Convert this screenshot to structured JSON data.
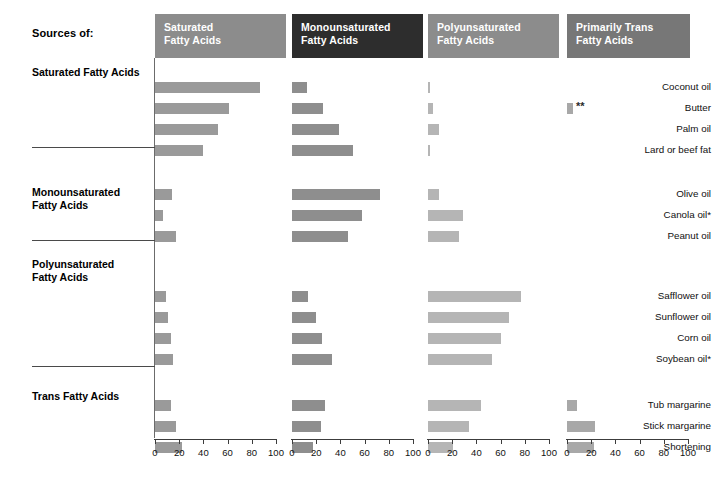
{
  "title_label": "Sources of:",
  "footnote_marks": {
    "double_asterisk": "**"
  },
  "caption": "",
  "colors": {
    "header_saturated": "#8c8c8c",
    "header_monounsaturated": "#2d2d2d",
    "header_polyunsaturated": "#8c8c8c",
    "header_trans": "#777777",
    "bar_saturated": "#9a9a9a",
    "bar_monounsaturated": "#8e8e8e",
    "bar_polyunsaturated": "#b5b5b5",
    "bar_trans": "#a8a8a8",
    "axis": "#3c3c3c",
    "rule": "#4a4a4a",
    "text": "#111111"
  },
  "chart_data": {
    "type": "bar",
    "xlabel": "",
    "ylabel": "",
    "xlim": [
      0,
      100
    ],
    "xticks": [
      0,
      20,
      40,
      60,
      80,
      100
    ],
    "grid": false,
    "legend": "none",
    "panels": [
      {
        "key": "saturated",
        "label": "Saturated\nFatty Acids"
      },
      {
        "key": "monounsaturated",
        "label": "Monounsaturated\nFatty Acids"
      },
      {
        "key": "polyunsaturated",
        "label": "Polyunsaturated\nFatty Acids"
      },
      {
        "key": "trans",
        "label": "Primarily Trans\nFatty Acids"
      }
    ],
    "groups": [
      {
        "title": "Saturated Fatty Acids",
        "rows": [
          {
            "label": "Coconut oil",
            "values": [
              87,
              12,
              2,
              0
            ]
          },
          {
            "label": "Butter",
            "values": [
              61,
              26,
              4,
              5
            ],
            "marks": [
              null,
              null,
              null,
              "**"
            ]
          },
          {
            "label": "Palm oil",
            "values": [
              52,
              39,
              9,
              0
            ]
          },
          {
            "label": "Lard or beef fat",
            "values": [
              40,
              50,
              2,
              0
            ]
          }
        ]
      },
      {
        "title": "Monounsaturated\nFatty Acids",
        "rows": [
          {
            "label": "Olive oil",
            "values": [
              14,
              73,
              9,
              0
            ]
          },
          {
            "label": "Canola oil*",
            "values": [
              7,
              58,
              29,
              0
            ]
          },
          {
            "label": "Peanut oil",
            "values": [
              17,
              46,
              26,
              0
            ]
          }
        ]
      },
      {
        "title": "Polyunsaturated\nFatty Acids",
        "rows": [
          {
            "label": "Safflower oil",
            "values": [
              9,
              13,
              77,
              0
            ]
          },
          {
            "label": "Sunflower oil",
            "values": [
              11,
              20,
              67,
              0
            ]
          },
          {
            "label": "Corn oil",
            "values": [
              13,
              25,
              60,
              0
            ]
          },
          {
            "label": "Soybean oil*",
            "values": [
              15,
              33,
              53,
              0
            ]
          }
        ]
      },
      {
        "title": "Trans Fatty Acids",
        "rows": [
          {
            "label": "Tub margarine",
            "values": [
              13,
              27,
              44,
              8
            ]
          },
          {
            "label": "Stick margarine",
            "values": [
              17,
              24,
              34,
              23
            ]
          },
          {
            "label": "Shortening",
            "values": [
              22,
              17,
              21,
              22
            ]
          }
        ]
      }
    ]
  }
}
